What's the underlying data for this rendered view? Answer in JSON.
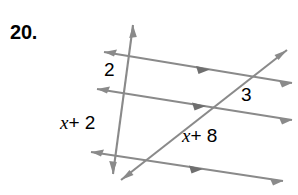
{
  "figure": {
    "problem_number": "20.",
    "line_color": "#8a8a8a",
    "label_color": "#000000",
    "background_color": "#ffffff",
    "labels": {
      "segment_top_left": "2",
      "segment_bottom_left": "x + 2",
      "segment_right_upper": "3",
      "segment_diagonal": "x + 8",
      "segment_bottom_left_var": "x",
      "segment_bottom_left_rest": "+ 2",
      "segment_diagonal_var": "x",
      "segment_diagonal_rest": "+ 8"
    },
    "lines": [
      {
        "name": "parallel-line-top",
        "x1": 104,
        "y1": 52,
        "x2": 292,
        "y2": 83,
        "arrow_start": true,
        "arrow_end": true,
        "mid_arrow_at": 0.52
      },
      {
        "name": "parallel-line-middle",
        "x1": 97,
        "y1": 89,
        "x2": 292,
        "y2": 120,
        "arrow_start": true,
        "arrow_end": true,
        "mid_arrow_at": 0.52
      },
      {
        "name": "parallel-line-bottom",
        "x1": 91,
        "y1": 152,
        "x2": 283,
        "y2": 181,
        "arrow_start": true,
        "arrow_end": true,
        "mid_arrow_at": 0.55
      },
      {
        "name": "transversal-vertical",
        "x1": 133,
        "y1": 25,
        "x2": 113,
        "y2": 174,
        "arrow_start": true,
        "arrow_end": true,
        "mid_arrow_at": null
      },
      {
        "name": "transversal-diagonal",
        "x1": 287,
        "y1": 50,
        "x2": 121,
        "y2": 180,
        "arrow_start": true,
        "arrow_end": true,
        "mid_arrow_at": null
      }
    ]
  }
}
